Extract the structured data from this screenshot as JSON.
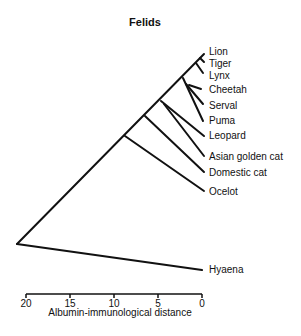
{
  "title": "Felids",
  "leaves": [
    {
      "label": "Lion",
      "y": 52
    },
    {
      "label": "Tiger",
      "y": 64
    },
    {
      "label": "Lynx",
      "y": 76
    },
    {
      "label": "Cheetah",
      "y": 90
    },
    {
      "label": "Serval",
      "y": 106
    },
    {
      "label": "Puma",
      "y": 121
    },
    {
      "label": "Leopard",
      "y": 136
    },
    {
      "label": "Asian golden cat",
      "y": 157
    },
    {
      "label": "Domestic cat",
      "y": 173
    },
    {
      "label": "Ocelot",
      "y": 192
    },
    {
      "label": "Hyaena",
      "y": 270
    }
  ],
  "axis": {
    "label": "Albumin-immunological distance",
    "ticks": [
      "20",
      "15",
      "10",
      "5",
      "0"
    ],
    "range": [
      20,
      0
    ]
  },
  "colors": {
    "line": "#111111",
    "background": "#ffffff"
  }
}
